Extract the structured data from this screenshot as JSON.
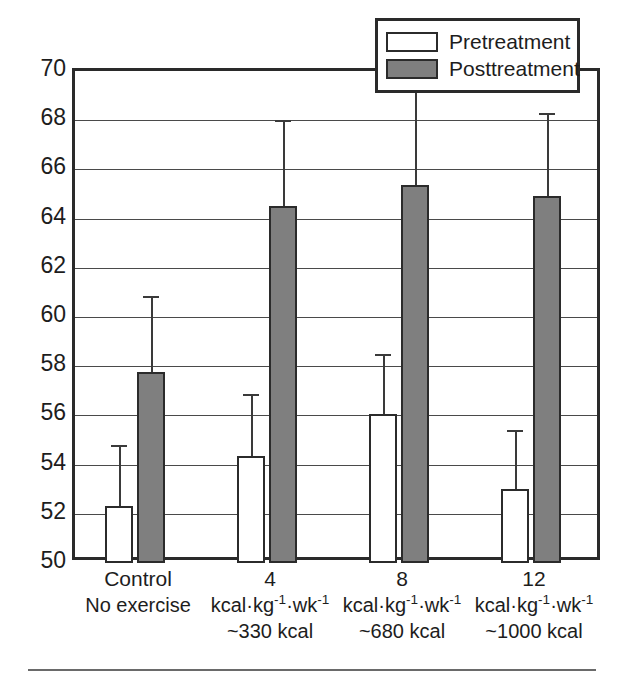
{
  "chart_data": {
    "type": "bar",
    "title": "",
    "subtitle": "",
    "xlabel": "",
    "ylabel": "",
    "ylim": [
      50,
      70
    ],
    "ytick_step": 2,
    "yticks": [
      70,
      68,
      66,
      64,
      62,
      60,
      58,
      56,
      54,
      52,
      50
    ],
    "grid": true,
    "legend_position": "top-right",
    "categories": [
      {
        "line1": "Control",
        "line2": "No exercise",
        "line3": ""
      },
      {
        "line1": "4",
        "line2": "kcal·kg⁻¹·wk⁻¹",
        "line3": "~330 kcal"
      },
      {
        "line1": "8",
        "line2": "kcal·kg⁻¹·wk⁻¹",
        "line3": "~680 kcal"
      },
      {
        "line1": "12",
        "line2": "kcal·kg⁻¹·wk⁻¹",
        "line3": "~1000 kcal"
      }
    ],
    "series": [
      {
        "name": "Pretreatment",
        "color": "#ffffff",
        "values": [
          52.3,
          54.35,
          56.05,
          53.0
        ],
        "error_upper": [
          54.8,
          56.85,
          58.5,
          55.4
        ]
      },
      {
        "name": "Posttreatment",
        "color": "#7f7f7f",
        "values": [
          57.75,
          64.5,
          65.35,
          64.9
        ],
        "error_upper": [
          60.85,
          68.0,
          69.3,
          68.3
        ]
      }
    ]
  },
  "legend": {
    "items": [
      {
        "label": "Pretreatment",
        "swatch": "pre"
      },
      {
        "label": "Posttreatment",
        "swatch": "post"
      }
    ]
  },
  "colors": {
    "pretreatment_fill": "#ffffff",
    "posttreatment_fill": "#7f7f7f",
    "outline": "#2b2b2b",
    "gridline": "#4a4a4a",
    "text": "#1d1d1d"
  }
}
